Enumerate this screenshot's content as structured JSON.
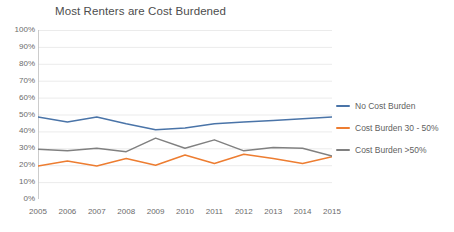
{
  "chart_data": {
    "type": "line",
    "title": "Most Renters are Cost Burdened",
    "xlabel": "",
    "ylabel": "",
    "categories": [
      "2005",
      "2006",
      "2007",
      "2008",
      "2009",
      "2010",
      "2011",
      "2012",
      "2013",
      "2014",
      "2015"
    ],
    "x": [
      2005,
      2006,
      2007,
      2008,
      2009,
      2010,
      2011,
      2012,
      2013,
      2014,
      2015
    ],
    "ylim": [
      0,
      100
    ],
    "ytick_labels": [
      "100%",
      "90%",
      "80%",
      "70%",
      "60%",
      "50%",
      "40%",
      "30%",
      "20%",
      "10%",
      "0%"
    ],
    "ytick_values": [
      100,
      90,
      80,
      70,
      60,
      50,
      40,
      30,
      20,
      10,
      0
    ],
    "grid": "horizontal",
    "legend_position": "right",
    "units": "percent",
    "series": [
      {
        "name": "No Cost Burden",
        "color": "#4a74a8",
        "values": [
          48.5,
          45.5,
          48.5,
          44.5,
          41.0,
          42.0,
          44.5,
          45.5,
          46.5,
          47.5,
          48.5
        ]
      },
      {
        "name": "Cost Burden 30 - 50%",
        "color": "#ed7d31",
        "values": [
          19.5,
          22.5,
          19.5,
          24.0,
          20.0,
          26.0,
          21.0,
          26.5,
          24.0,
          21.0,
          25.0
        ]
      },
      {
        "name": "Cost Burden >50%",
        "color": "#808080",
        "values": [
          29.5,
          28.5,
          30.0,
          28.0,
          36.0,
          30.0,
          35.0,
          28.5,
          30.5,
          30.0,
          25.5
        ]
      }
    ]
  },
  "legend": {
    "items": [
      {
        "label": "No Cost Burden",
        "color": "#4a74a8"
      },
      {
        "label": "Cost Burden 30 - 50%",
        "color": "#ed7d31"
      },
      {
        "label": "Cost Burden >50%",
        "color": "#808080"
      }
    ]
  }
}
